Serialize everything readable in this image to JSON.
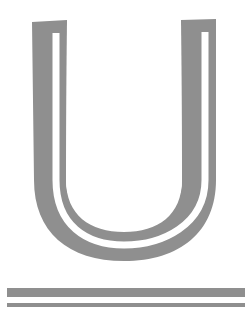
{
  "figure": {
    "glyph": "U",
    "style": "inline-outlined block letter with double rule underline",
    "colors": {
      "ink": "#8f8f8f",
      "background": "#ffffff"
    },
    "rules": [
      {
        "name": "thick-rule",
        "thickness": 9
      },
      {
        "name": "thin-rule",
        "thickness": 4
      }
    ]
  }
}
